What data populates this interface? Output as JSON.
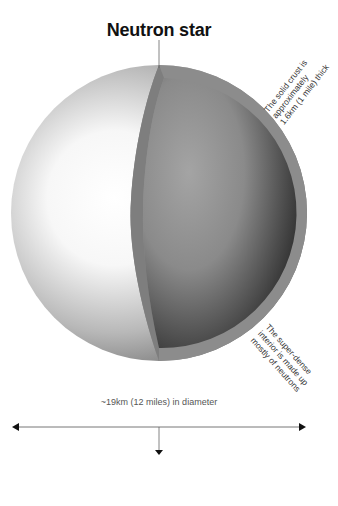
{
  "title": "Neutron star",
  "labels": {
    "crust": [
      "The solid crust is",
      "approximately",
      "1.6km (1 mile) thick"
    ],
    "interior": [
      "The super-dense",
      "interior is made up",
      "mostly of neutrons"
    ],
    "diameter": "~19km (12 miles) in diameter"
  },
  "colors": {
    "crust": "#8c8c8c",
    "interior_light": "#a0a0a0",
    "interior_dark": "#2e2e2e",
    "surface_light": "#ffffff",
    "surface_dark": "#6e6e6e",
    "text": "#333333",
    "line": "#666666"
  }
}
